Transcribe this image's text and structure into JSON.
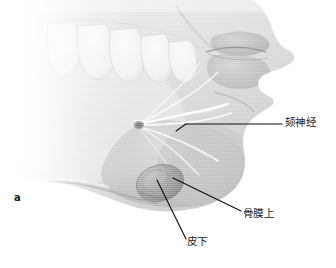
{
  "figure": {
    "marker": "a",
    "background_color": "#ffffff",
    "skin_tone": "#c9c9c9",
    "leader_line_color": "#101010",
    "nerve_highlight_color": "#ffffff",
    "bleb_color": "#9a9a9a"
  },
  "labels": [
    {
      "id": "mental-nerve",
      "text": "颏神经",
      "leader": "horizontal line from label left edge to nerve trunk"
    },
    {
      "id": "supraperiosteal",
      "text": "骨膜上",
      "leader": "diagonal line from label up-left to bleb outer wall"
    },
    {
      "id": "subcutaneous",
      "text": "皮下",
      "leader": "diagonal line from label up-left to bleb center"
    }
  ],
  "anatomy": {
    "teeth_count": 5,
    "features": [
      "upper-lip",
      "lower-lip",
      "chin",
      "mandible-border",
      "teeth-row",
      "mental-foramen",
      "mental-nerve-branches",
      "anesthetic-bleb"
    ]
  }
}
